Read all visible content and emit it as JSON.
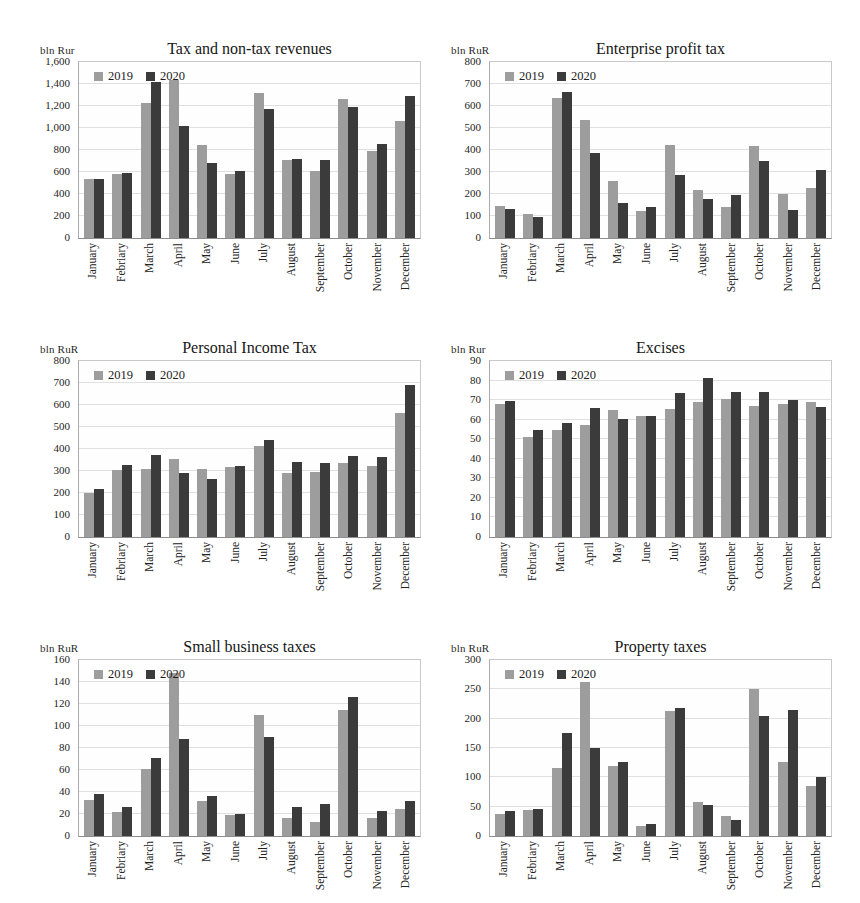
{
  "page": {
    "width": 860,
    "height": 903
  },
  "colors": {
    "series_2019": "#9d9d9d",
    "series_2020": "#3b3b3b",
    "gridline": "#e0e0e0",
    "text": "#1e1e1e"
  },
  "legend": {
    "labels": [
      "2019",
      "2020"
    ],
    "position": "top-left"
  },
  "months": [
    "January",
    "Febriary",
    "March",
    "April",
    "May",
    "June",
    "July",
    "August",
    "September",
    "October",
    "November",
    "December"
  ],
  "chart_data": [
    {
      "type": "bar",
      "title": "Tax and non-tax revenues",
      "unit": "bln Rur",
      "categories": [
        "January",
        "Febriary",
        "March",
        "April",
        "May",
        "June",
        "July",
        "August",
        "September",
        "October",
        "November",
        "December"
      ],
      "series": [
        {
          "name": "2019",
          "values": [
            535,
            585,
            1230,
            1440,
            845,
            580,
            1315,
            710,
            605,
            1265,
            795,
            1060
          ]
        },
        {
          "name": "2020",
          "values": [
            540,
            595,
            1415,
            1015,
            685,
            610,
            1170,
            720,
            705,
            1190,
            855,
            1290
          ]
        }
      ],
      "ylim": [
        0,
        1600
      ],
      "ytick_step": 200,
      "ytick_labels": [
        "0",
        "200",
        "400",
        "600",
        "800",
        "1,000",
        "1,200",
        "1,400",
        "1,600"
      ],
      "grid": true,
      "legend_position": "top-left"
    },
    {
      "type": "bar",
      "title": "Enterprise profit tax",
      "unit": "bln RuR",
      "categories": [
        "January",
        "Febriary",
        "March",
        "April",
        "May",
        "June",
        "July",
        "August",
        "September",
        "October",
        "November",
        "December"
      ],
      "series": [
        {
          "name": "2019",
          "values": [
            145,
            110,
            635,
            535,
            260,
            125,
            425,
            220,
            140,
            420,
            200,
            228
          ]
        },
        {
          "name": "2020",
          "values": [
            130,
            95,
            665,
            385,
            160,
            140,
            288,
            178,
            195,
            352,
            128,
            308
          ]
        }
      ],
      "ylim": [
        0,
        800
      ],
      "ytick_step": 100,
      "ytick_labels": [
        "0",
        "100",
        "200",
        "300",
        "400",
        "500",
        "600",
        "700",
        "800"
      ],
      "grid": true,
      "legend_position": "top-left"
    },
    {
      "type": "bar",
      "title": "Personal Income Tax",
      "unit": "bln RuR",
      "categories": [
        "January",
        "Febriary",
        "March",
        "April",
        "May",
        "June",
        "July",
        "August",
        "September",
        "October",
        "November",
        "December"
      ],
      "series": [
        {
          "name": "2019",
          "values": [
            200,
            305,
            308,
            355,
            308,
            318,
            415,
            293,
            295,
            335,
            325,
            565
          ]
        },
        {
          "name": "2020",
          "values": [
            218,
            328,
            372,
            292,
            265,
            325,
            440,
            340,
            335,
            370,
            365,
            690
          ]
        }
      ],
      "ylim": [
        0,
        800
      ],
      "ytick_step": 100,
      "ytick_labels": [
        "0",
        "100",
        "200",
        "300",
        "400",
        "500",
        "600",
        "700",
        "800"
      ],
      "grid": true,
      "legend_position": "top-left"
    },
    {
      "type": "bar",
      "title": "Excises",
      "unit": "bln Rur",
      "categories": [
        "January",
        "Febriary",
        "March",
        "April",
        "May",
        "June",
        "July",
        "August",
        "September",
        "October",
        "November",
        "December"
      ],
      "series": [
        {
          "name": "2019",
          "values": [
            68,
            51,
            54.5,
            57.5,
            65,
            62,
            65.5,
            69,
            70.5,
            67,
            68,
            69
          ]
        },
        {
          "name": "2020",
          "values": [
            69.5,
            54.5,
            58.5,
            66,
            60.5,
            62,
            73.5,
            81.5,
            74,
            74,
            70,
            66.5
          ]
        }
      ],
      "ylim": [
        0,
        90
      ],
      "ytick_step": 10,
      "ytick_labels": [
        "0",
        "10",
        "20",
        "30",
        "40",
        "50",
        "60",
        "70",
        "80",
        "90"
      ],
      "grid": true,
      "legend_position": "top-left"
    },
    {
      "type": "bar",
      "title": "Small business taxes",
      "unit": "bln RuR",
      "categories": [
        "January",
        "Febriary",
        "March",
        "April",
        "May",
        "June",
        "July",
        "August",
        "September",
        "October",
        "November",
        "December"
      ],
      "series": [
        {
          "name": "2019",
          "values": [
            33,
            22,
            61,
            148,
            32,
            19,
            110,
            16,
            13,
            115,
            16,
            25
          ]
        },
        {
          "name": "2020",
          "values": [
            38,
            26,
            71,
            88,
            36,
            20,
            90,
            26,
            29,
            126,
            23,
            32
          ]
        }
      ],
      "ylim": [
        0,
        160
      ],
      "ytick_step": 20,
      "ytick_labels": [
        "0",
        "20",
        "40",
        "60",
        "80",
        "100",
        "120",
        "140",
        "160"
      ],
      "grid": true,
      "legend_position": "top-left"
    },
    {
      "type": "bar",
      "title": "Property taxes",
      "unit": "bln RuR",
      "categories": [
        "January",
        "Febriary",
        "March",
        "April",
        "May",
        "June",
        "July",
        "August",
        "September",
        "October",
        "November",
        "December"
      ],
      "series": [
        {
          "name": "2019",
          "values": [
            38,
            44,
            116,
            262,
            120,
            17,
            213,
            58,
            34,
            250,
            127,
            85
          ]
        },
        {
          "name": "2020",
          "values": [
            42,
            46,
            176,
            150,
            126,
            21,
            219,
            53,
            28,
            205,
            215,
            100
          ]
        }
      ],
      "ylim": [
        0,
        300
      ],
      "ytick_step": 50,
      "ytick_labels": [
        "0",
        "50",
        "100",
        "150",
        "200",
        "250",
        "300"
      ],
      "grid": true,
      "legend_position": "top-left"
    }
  ]
}
